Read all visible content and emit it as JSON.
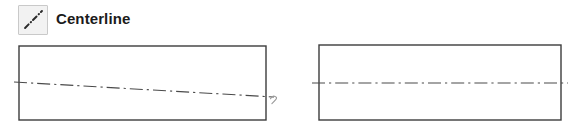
{
  "toolbar": {
    "tool_label": "Centerline",
    "tool_icon": "centerline-diagonal-dashdot-icon",
    "button_fill": "#f2f2f2",
    "button_border": "#c9c9c9",
    "label_color": "#1b1b1b"
  },
  "drawing": {
    "outline_color": "#3c3c3c",
    "centerline_color": "#4a4a4a",
    "annotation_color": "#9a9a9a",
    "background": "#ffffff",
    "shapes": [
      {
        "name": "left-part-rectangle",
        "type": "rectangle",
        "x": 19,
        "y": 8,
        "width": 247,
        "height": 74,
        "centerline": {
          "name": "sloped-centerline",
          "orientation": "sloped",
          "x1": 14,
          "y1": 44,
          "x2": 274,
          "y2": 59
        },
        "annotation": {
          "name": "squiggle-mark",
          "glyph": "squiggle",
          "x": 270,
          "y": 60
        }
      },
      {
        "name": "right-part-rectangle",
        "type": "rectangle",
        "x": 319,
        "y": 7,
        "width": 242,
        "height": 75,
        "centerline": {
          "name": "horizontal-centerline",
          "orientation": "horizontal",
          "x1": 312,
          "y1": 45,
          "x2": 568,
          "y2": 45
        }
      }
    ]
  }
}
